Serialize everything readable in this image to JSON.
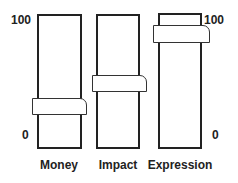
{
  "scale": {
    "left": {
      "max_label": "100",
      "min_label": "0"
    },
    "right": {
      "max_label": "100",
      "min_label": "0"
    }
  },
  "sliders": [
    {
      "label": "Money",
      "value": 31
    },
    {
      "label": "Impact",
      "value": 49
    },
    {
      "label": "Expression",
      "value": 86
    }
  ],
  "colors": {
    "stroke": "#222222",
    "fill": "#ffffff"
  }
}
